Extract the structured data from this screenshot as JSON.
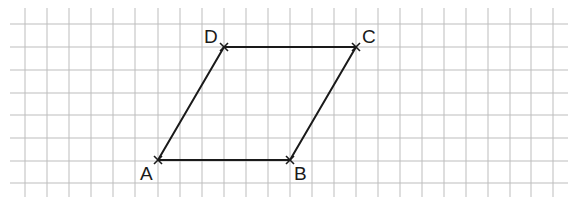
{
  "diagram": {
    "type": "parallelogram-on-grid",
    "grid": {
      "x_lines": [
        25,
        47,
        69,
        91,
        113,
        135,
        158,
        180,
        202,
        224,
        246,
        268,
        290,
        312,
        334,
        356,
        378,
        400,
        422,
        444,
        466,
        488,
        510,
        531,
        553
      ],
      "y_lines": [
        24,
        47,
        70,
        93,
        115,
        138,
        161,
        183
      ],
      "x_extent": [
        10,
        568
      ],
      "y_extent": [
        8,
        197
      ],
      "color": "#bdbdbd"
    },
    "points": [
      {
        "name": "A",
        "label": "A",
        "x": 158,
        "y": 160,
        "lx": 140,
        "ly": 180
      },
      {
        "name": "B",
        "label": "B",
        "x": 290,
        "y": 160,
        "lx": 294,
        "ly": 180
      },
      {
        "name": "C",
        "label": "C",
        "x": 356,
        "y": 47,
        "lx": 362,
        "ly": 43
      },
      {
        "name": "D",
        "label": "D",
        "x": 224,
        "y": 47,
        "lx": 204,
        "ly": 43
      }
    ],
    "edges": [
      [
        "A",
        "B"
      ],
      [
        "B",
        "C"
      ],
      [
        "C",
        "D"
      ],
      [
        "D",
        "A"
      ]
    ],
    "line_color": "#1a1a1a"
  }
}
